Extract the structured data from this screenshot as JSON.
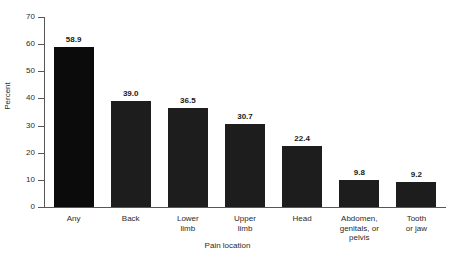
{
  "chart_data": {
    "type": "bar",
    "title": "",
    "xlabel": "Pain location",
    "ylabel": "Percent",
    "categories": [
      "Any",
      "Back",
      "Lower\nlimb",
      "Upper\nlimb",
      "Head",
      "Abdomen,\ngenitals, or\npelvis",
      "Tooth\nor jaw"
    ],
    "values": [
      58.9,
      39.0,
      36.5,
      30.7,
      22.4,
      9.8,
      9.2
    ],
    "value_labels": [
      "58.9",
      "39.0",
      "36.5",
      "30.7",
      "22.4",
      "9.8",
      "9.2"
    ],
    "ylim": [
      0,
      70
    ],
    "yticks": [
      0,
      10,
      20,
      30,
      40,
      50,
      60,
      70
    ],
    "ytick_labels": [
      "0",
      "10",
      "20",
      "30",
      "40",
      "50",
      "60",
      "70"
    ],
    "grid": false,
    "legend": null,
    "bar_color": "#1d1d1d",
    "first_bar_color": "#0b0b0b",
    "axis_color": "#575757",
    "background": "#ffffff"
  },
  "axes": {
    "y_title": "Percent",
    "x_title": "Pain location"
  }
}
